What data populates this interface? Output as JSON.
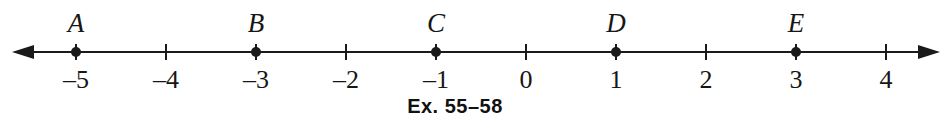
{
  "figure": {
    "type": "number-line",
    "caption": "Ex. 55–58",
    "axis": {
      "orientation": "horizontal",
      "left_arrow": true,
      "right_arrow": true,
      "min_tick": -5,
      "max_tick": 4,
      "pixels_per_unit": 90,
      "origin_x": 526,
      "axis_y": 52,
      "line_color": "#1a1a1a",
      "line_width": 2,
      "tick_height": 16,
      "background": "#ffffff"
    },
    "ticks": [
      {
        "value": -5,
        "label": "–5"
      },
      {
        "value": -4,
        "label": "–4"
      },
      {
        "value": -3,
        "label": "–3"
      },
      {
        "value": -2,
        "label": "–2"
      },
      {
        "value": -1,
        "label": "–1"
      },
      {
        "value": 0,
        "label": "0"
      },
      {
        "value": 1,
        "label": "1"
      },
      {
        "value": 2,
        "label": "2"
      },
      {
        "value": 3,
        "label": "3"
      },
      {
        "value": 4,
        "label": "4"
      }
    ],
    "points": [
      {
        "name": "A",
        "value": -5
      },
      {
        "name": "B",
        "value": -3
      },
      {
        "name": "C",
        "value": -1
      },
      {
        "name": "D",
        "value": 1
      },
      {
        "name": "E",
        "value": 3
      }
    ]
  },
  "chart_data": {
    "type": "scatter",
    "title": "Ex. 55–58",
    "xlabel": "",
    "ylabel": "",
    "xlim": [
      -5.5,
      4.5
    ],
    "grid": false,
    "legend": "none",
    "tick_labels": [
      "–5",
      "–4",
      "–3",
      "–2",
      "–1",
      "0",
      "1",
      "2",
      "3",
      "4"
    ],
    "tick_values": [
      -5,
      -4,
      -3,
      -2,
      -1,
      0,
      1,
      2,
      3,
      4
    ],
    "categories": [
      "A",
      "B",
      "C",
      "D",
      "E"
    ],
    "values": [
      -5,
      -3,
      -1,
      1,
      3
    ],
    "annotations": [
      "A at -5",
      "B at -3",
      "C at -1",
      "D at 1",
      "E at 3"
    ]
  }
}
